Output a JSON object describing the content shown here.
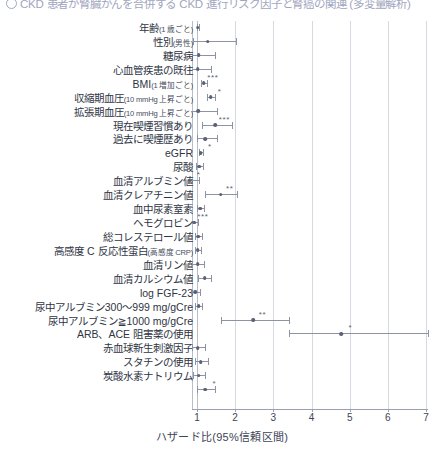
{
  "figure": {
    "title": "CKD 患者が腎臓がんを合併する CKD 進行リスク因子と腎癌の関連 (多変量解析)",
    "title_bullet_icon": "circled-number-icon",
    "axis_title": "ハザード比(95%信頼区間)",
    "reference_line": 1
  },
  "chart_data": {
    "type": "scatter",
    "subtype": "forest-plot",
    "title": "CKD 患者が腎臓がんを合併する CKD 進行リスク因子と腎癌の関連 (多変量解析)",
    "xlabel": "ハザード比(95%信頼区間)",
    "ylabel": "",
    "xlim": [
      0.87,
      7.05
    ],
    "xticks": [
      1,
      2,
      3,
      4,
      5,
      6,
      7
    ],
    "xticklabels": [
      "1",
      "2",
      "3",
      "4",
      "5",
      "6",
      "7"
    ],
    "grid": "vertical",
    "legend": "none",
    "reference_line": 1,
    "significance_legend": [
      "*",
      "**",
      "***"
    ],
    "rows": [
      {
        "label": "年齢",
        "unit": "(1 歳ごと)",
        "hr": 1.02,
        "lo": 1.0,
        "hi": 1.05,
        "sig": ""
      },
      {
        "label": "性別",
        "unit": "(男性)",
        "hr": 1.28,
        "lo": 0.9,
        "hi": 2.02,
        "sig": ""
      },
      {
        "label": "糖尿病",
        "unit": "",
        "hr": 1.05,
        "lo": 0.8,
        "hi": 1.47,
        "sig": ""
      },
      {
        "label": "心血管疾患の既往",
        "unit": "",
        "hr": 1.02,
        "lo": 0.76,
        "hi": 1.36,
        "sig": ""
      },
      {
        "label": "BMI",
        "unit": "(1 増加ごと)",
        "hr": 1.18,
        "lo": 1.1,
        "hi": 1.26,
        "sig": "***"
      },
      {
        "label": "収縮期血圧",
        "unit": "(10 mmHg 上昇ごと)",
        "hr": 1.36,
        "lo": 1.26,
        "hi": 1.46,
        "sig": "*"
      },
      {
        "label": "拡張期血圧",
        "unit": "(10 mmHg 上昇ごと)",
        "hr": 1.03,
        "lo": 0.6,
        "hi": 1.52,
        "sig": ""
      },
      {
        "label": "現在喫煙習慣あり",
        "unit": "",
        "hr": 1.48,
        "lo": 1.12,
        "hi": 1.93,
        "sig": "***"
      },
      {
        "label": "過去に喫煙歴あり",
        "unit": "",
        "hr": 1.22,
        "lo": 0.99,
        "hi": 1.52,
        "sig": ""
      },
      {
        "label": "eGFR",
        "unit": "",
        "hr": 1.1,
        "lo": 1.05,
        "hi": 1.16,
        "sig": "*"
      },
      {
        "label": "尿酸",
        "unit": "",
        "hr": 1.06,
        "lo": 0.98,
        "hi": 1.16,
        "sig": ""
      },
      {
        "label": "血清アルブミン値",
        "unit": "",
        "hr": 0.81,
        "lo": 0.7,
        "hi": 1.06,
        "sig": "*"
      },
      {
        "label": "血清クレアチニン値",
        "unit": "",
        "hr": 1.62,
        "lo": 1.22,
        "hi": 2.04,
        "sig": "**"
      },
      {
        "label": "血中尿素窒素",
        "unit": "",
        "hr": 1.08,
        "lo": 1.0,
        "hi": 1.18,
        "sig": ""
      },
      {
        "label": "ヘモグロビン",
        "unit": "",
        "hr": 0.92,
        "lo": 0.84,
        "hi": 1.02,
        "sig": "***"
      },
      {
        "label": "総コレステロール値",
        "unit": "",
        "hr": 1.04,
        "lo": 0.96,
        "hi": 1.13,
        "sig": ""
      },
      {
        "label": "高感度 C 反応性蛋白",
        "unit": "(高感度 CRP)",
        "hr": 1.02,
        "lo": 0.95,
        "hi": 1.1,
        "sig": ""
      },
      {
        "label": "血清リン値",
        "unit": "",
        "hr": 1.02,
        "lo": 0.88,
        "hi": 1.18,
        "sig": ""
      },
      {
        "label": "血清カルシウム値",
        "unit": "",
        "hr": 1.2,
        "lo": 1.04,
        "hi": 1.38,
        "sig": ""
      },
      {
        "label": "log FGF-23",
        "unit": "",
        "hr": 0.95,
        "lo": 0.82,
        "hi": 1.07,
        "sig": ""
      },
      {
        "label": "尿中アルブミン300〜999 mg/gCre",
        "unit": "",
        "hr": 1.05,
        "lo": 0.96,
        "hi": 1.14,
        "sig": ""
      },
      {
        "label": "尿中アルブミン≧1000 mg/gCre",
        "unit": "",
        "hr": 2.48,
        "lo": 1.62,
        "hi": 3.4,
        "sig": "**"
      },
      {
        "label": "ARB、ACE 阻害薬の使用",
        "unit": "",
        "hr": 4.78,
        "lo": 3.42,
        "hi": 7.05,
        "sig": "*"
      },
      {
        "label": "赤血球新生刺激因子",
        "unit": "",
        "hr": 1.02,
        "lo": 0.87,
        "hi": 1.2,
        "sig": ""
      },
      {
        "label": "スタチンの使用",
        "unit": "",
        "hr": 1.1,
        "lo": 0.94,
        "hi": 1.28,
        "sig": ""
      },
      {
        "label": "炭酸水素ナトリウム",
        "unit": "",
        "hr": 1.05,
        "lo": 0.9,
        "hi": 1.22,
        "sig": ""
      },
      {
        "label": "",
        "unit": "",
        "hr": 1.22,
        "lo": 1.0,
        "hi": 1.46,
        "sig": "*"
      }
    ]
  },
  "colors": {
    "point": "#5b6276",
    "interval": "#8d93a3",
    "grid": "#d6d9e2",
    "axis": "#9aa0ad",
    "text": "#2f3545",
    "title": "#9fa6c0"
  }
}
